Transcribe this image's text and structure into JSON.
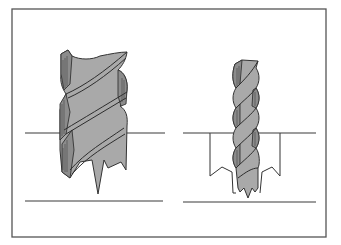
{
  "figure": {
    "colors": {
      "bit_fill": "#a9a9a9",
      "flute_shade": "#8c8c8c",
      "outline": "#333333",
      "frame": "#555555",
      "background": "#ffffff"
    },
    "panels": [
      {
        "id": "left",
        "subject": "wide auger bit",
        "state": "positioned at surface with center spur and cutting spurs"
      },
      {
        "id": "right",
        "subject": "narrow twist auger bit",
        "state": "drilling into workpiece, hole walls shown"
      }
    ]
  }
}
